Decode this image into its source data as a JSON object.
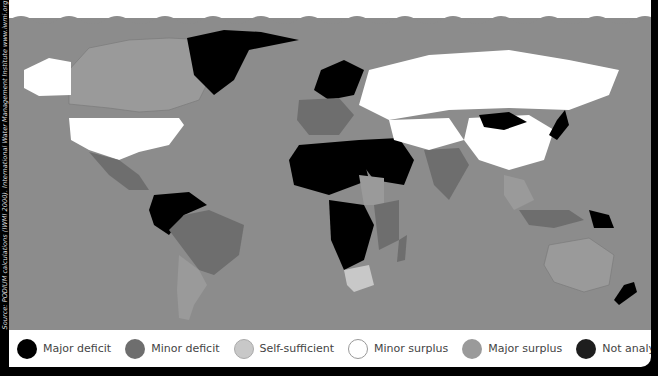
{
  "source_text": "Source: PODIUM calculations (IWMI 2000). International Water Management Institute  www.iwmi.org",
  "colors": {
    "ocean": "#8c8c8c",
    "major_deficit": "#000000",
    "minor_deficit": "#6e6e6e",
    "self_sufficient": "#c8c8c8",
    "minor_surplus": "#ffffff",
    "major_surplus": "#9a9a9a",
    "not_analysed": "#1e1e1e"
  },
  "legend": [
    {
      "label": "Major deficit",
      "color": "#000000"
    },
    {
      "label": "Minor deficit",
      "color": "#6e6e6e"
    },
    {
      "label": "Self-sufficient",
      "color": "#c8c8c8"
    },
    {
      "label": "Minor surplus",
      "color": "#ffffff"
    },
    {
      "label": "Major surplus",
      "color": "#9a9a9a"
    },
    {
      "label": "Not analysed",
      "color": "#1e1e1e"
    }
  ]
}
